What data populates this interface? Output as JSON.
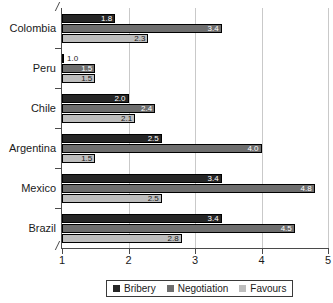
{
  "chart_data": {
    "type": "bar",
    "orientation": "horizontal",
    "title": "",
    "xlabel": "",
    "ylabel": "",
    "xlim": [
      1,
      5
    ],
    "xticks": [
      1,
      2,
      3,
      4,
      5
    ],
    "xtick_labels": [
      "1",
      "2",
      "3",
      "4",
      "5"
    ],
    "grid": true,
    "grid_axis": "x",
    "legend_position": "bottom",
    "categories": [
      "Colombia",
      "Peru",
      "Chile",
      "Argentina",
      "Mexico",
      "Brazil"
    ],
    "series": [
      {
        "name": "Bribery",
        "color": "#262626",
        "values": [
          1.8,
          1.0,
          2.0,
          2.5,
          3.4,
          3.4
        ],
        "labels": [
          "1.8",
          "1.0",
          "2.0",
          "2.5",
          "3.4",
          "3.4"
        ]
      },
      {
        "name": "Negotiation",
        "color": "#6e6e6e",
        "values": [
          3.4,
          1.5,
          2.4,
          4.0,
          4.8,
          4.5
        ],
        "labels": [
          "3.4",
          "1.5",
          "2.4",
          "4.0",
          "4.8",
          "4.5"
        ]
      },
      {
        "name": "Favours",
        "color": "#bdbdbd",
        "values": [
          2.3,
          1.5,
          2.1,
          1.5,
          2.5,
          2.8
        ],
        "labels": [
          "2.3",
          "1.5",
          "2.1",
          "1.5",
          "2.5",
          "2.8"
        ]
      }
    ]
  },
  "legend": {
    "items": [
      {
        "label": "Bribery"
      },
      {
        "label": "Negotiation"
      },
      {
        "label": "Favours"
      }
    ]
  }
}
